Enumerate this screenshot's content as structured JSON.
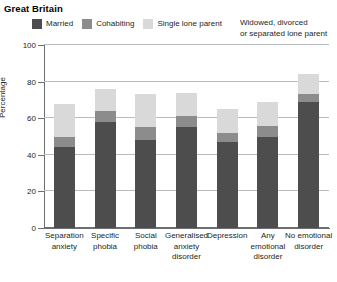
{
  "title": "Great Britain",
  "legend": {
    "items": [
      {
        "label": "Married",
        "color": "#4d4d4d"
      },
      {
        "label": "Cohabiting",
        "color": "#8c8c8c"
      },
      {
        "label": "Single lone parent",
        "color": "#d9d9d9"
      }
    ],
    "extra_line1": "Widowed, divorced",
    "extra_line2": "or separated lone parent"
  },
  "chart_data": {
    "type": "bar",
    "stacked": true,
    "title": "Great Britain",
    "xlabel": "",
    "ylabel": "Percentage",
    "ylim": [
      0,
      100
    ],
    "yticks": [
      0,
      20,
      40,
      60,
      80,
      100
    ],
    "grid": true,
    "legend_position": "top",
    "categories": [
      "Separation anxiety",
      "Specific phobia",
      "Social phobia",
      "Generalised anxiety disorder",
      "Depression",
      "Any emotional disorder",
      "No emotional disorder"
    ],
    "category_lines": [
      [
        "Separation",
        "anxiety"
      ],
      [
        "Specific",
        "phobia"
      ],
      [
        "Social",
        "phobia"
      ],
      [
        "Generalised",
        "anxiety",
        "disorder"
      ],
      [
        "Depression"
      ],
      [
        "Any",
        "emotional",
        "disorder"
      ],
      [
        "No emotional",
        "disorder"
      ]
    ],
    "series": [
      {
        "name": "Married",
        "color": "#4d4d4d",
        "values": [
          44,
          58,
          48,
          55,
          47,
          50,
          69
        ]
      },
      {
        "name": "Cohabiting",
        "color": "#8c8c8c",
        "values": [
          6,
          6,
          7,
          6,
          5,
          6,
          4
        ]
      },
      {
        "name": "Single lone parent",
        "color": "#d9d9d9",
        "values": [
          18,
          12,
          18,
          13,
          13,
          13,
          11
        ]
      }
    ],
    "totals": [
      68,
      76,
      73,
      74,
      65,
      69,
      84
    ]
  }
}
